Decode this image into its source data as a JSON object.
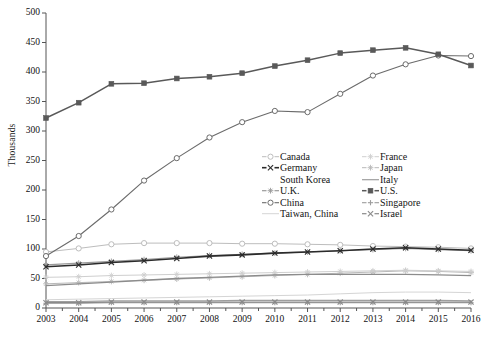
{
  "chart_data": {
    "type": "line",
    "title": "",
    "subtitle": "",
    "xlabel": "",
    "ylabel": "Thousands",
    "xlim": [
      2003,
      2016
    ],
    "ylim": [
      0,
      500
    ],
    "ytick_step": 50,
    "grid": false,
    "legend_position": "inside-center-right",
    "categories": [
      2003,
      2004,
      2005,
      2006,
      2007,
      2008,
      2009,
      2010,
      2011,
      2012,
      2013,
      2014,
      2015,
      2016
    ],
    "x": [
      "2003",
      "2004",
      "2005",
      "2006",
      "2007",
      "2008",
      "2009",
      "2010",
      "2011",
      "2012",
      "2013",
      "2014",
      "2015",
      "2016"
    ],
    "yticks": [
      "0",
      "50",
      "100",
      "150",
      "200",
      "250",
      "300",
      "350",
      "400",
      "450",
      "500"
    ],
    "series": [
      {
        "name": "U.S.",
        "marker": "filled-square",
        "color": "#595959",
        "width": 1.5,
        "values": [
          322,
          348,
          380,
          381,
          389,
          392,
          398,
          410,
          420,
          432,
          437,
          441,
          430,
          411
        ]
      },
      {
        "name": "China",
        "marker": "open-circle",
        "color": "#6b6b6b",
        "width": 1.1,
        "values": [
          88,
          122,
          167,
          216,
          254,
          289,
          315,
          334,
          332,
          363,
          394,
          413,
          428,
          0
        ]
      },
      {
        "name": "Canada",
        "marker": "open-circle",
        "color": "#bdbdbd",
        "width": 1.0,
        "values": [
          95,
          101,
          108,
          110,
          110,
          110,
          109,
          109,
          108,
          107,
          105,
          104,
          103,
          101
        ]
      },
      {
        "name": "Germany",
        "marker": "x-cross",
        "color": "#2b2b2b",
        "width": 1.6,
        "values": [
          70,
          73,
          77,
          80,
          84,
          88,
          90,
          93,
          95,
          97,
          100,
          102,
          100,
          98
        ]
      },
      {
        "name": "U.K.",
        "marker": "star-cross",
        "color": "#9a9a9a",
        "width": 1.2,
        "values": [
          73,
          76,
          79,
          82,
          86,
          89,
          91,
          93,
          95,
          97,
          99,
          101,
          99,
          97
        ]
      },
      {
        "name": "France",
        "marker": "star-cross",
        "color": "#cfcfcf",
        "width": 1.0,
        "values": [
          52,
          53,
          55,
          56,
          57,
          58,
          59,
          60,
          61,
          62,
          63,
          64,
          63,
          62
        ]
      },
      {
        "name": "Japan",
        "marker": "star-cross",
        "color": "#b8b8b8",
        "width": 1.0,
        "values": [
          41,
          43,
          45,
          47,
          49,
          51,
          53,
          55,
          57,
          59,
          61,
          63,
          62,
          60
        ]
      },
      {
        "name": "South Korea",
        "marker": "none",
        "color": "#8c8c8c",
        "width": 1.3,
        "values": [
          38,
          41,
          44,
          47,
          50,
          52,
          54,
          56,
          57,
          57,
          57,
          57,
          56,
          55
        ]
      },
      {
        "name": "Taiwan, China",
        "marker": "none",
        "color": "#d5d5d5",
        "width": 1.0,
        "values": [
          14,
          15,
          16,
          17,
          18,
          19,
          20,
          21,
          22,
          24,
          26,
          27,
          27,
          26
        ]
      },
      {
        "name": "Italy",
        "marker": "none",
        "color": "#9e9e9e",
        "width": 1.2,
        "values": [
          11,
          11,
          12,
          12,
          12,
          12,
          13,
          13,
          13,
          13,
          13,
          13,
          13,
          12
        ]
      },
      {
        "name": "Singapore",
        "marker": "plus",
        "color": "#9c9c9c",
        "width": 1.1,
        "values": [
          8,
          8,
          9,
          9,
          9,
          9,
          9,
          9,
          9,
          9,
          9,
          9,
          9,
          9
        ]
      },
      {
        "name": "Israel",
        "marker": "x-cross",
        "color": "#8a8a8a",
        "width": 1.2,
        "values": [
          9,
          9,
          10,
          10,
          10,
          10,
          10,
          10,
          10,
          10,
          10,
          10,
          10,
          10
        ]
      }
    ]
  },
  "china_last_value": 427,
  "legend": {
    "left_column": [
      {
        "label": "Canada",
        "series": "Canada"
      },
      {
        "label": "Germany",
        "series": "Germany"
      },
      {
        "label": "South Korea",
        "series": "South Korea"
      },
      {
        "label": "U.K.",
        "series": "U.K."
      },
      {
        "label": "China",
        "series": "China"
      },
      {
        "label": "Taiwan, China",
        "series": "Taiwan, China"
      }
    ],
    "right_column": [
      {
        "label": "France",
        "series": "France"
      },
      {
        "label": "Japan",
        "series": "Japan"
      },
      {
        "label": "Italy",
        "series": "Italy"
      },
      {
        "label": "U.S.",
        "series": "U.S."
      },
      {
        "label": "Singapore",
        "series": "Singapore"
      },
      {
        "label": "Israel",
        "series": "Israel"
      }
    ]
  },
  "axis": {
    "y_title": "Thousands",
    "axis_color": "#555555"
  }
}
